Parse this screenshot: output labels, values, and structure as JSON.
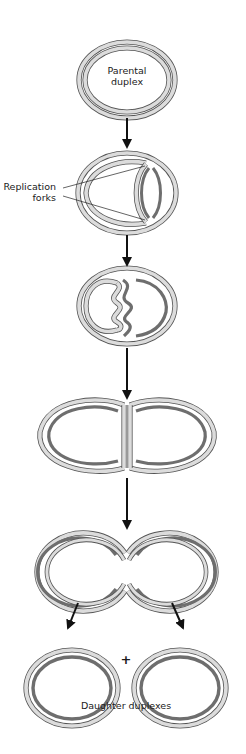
{
  "colors": {
    "outline": "#555555",
    "old_strand_fill": "#d9d9d9",
    "new_strand": "#6e6e6e",
    "arrow": "#111111",
    "text": "#1a1a1a",
    "background": "#ffffff"
  },
  "labels": {
    "parental": [
      "Parental",
      "duplex"
    ],
    "forks": [
      "Replication",
      "forks"
    ],
    "plus": "+",
    "daughters": "Daughter duplexes"
  },
  "stages": [
    {
      "id": "parental-duplex",
      "cx": 127,
      "cy": 80,
      "rx": 48,
      "ry": 38
    },
    {
      "id": "replication-forks",
      "cx": 127,
      "cy": 193,
      "rx": 49,
      "ry": 40
    },
    {
      "id": "supercoiled-intermediate",
      "cx": 127,
      "cy": 306,
      "rx": 48,
      "ry": 38
    },
    {
      "id": "catenated-pair",
      "cy": 437,
      "left_cx": 83,
      "right_cx": 169,
      "rx": 45,
      "ry": 37
    },
    {
      "id": "separating-pair",
      "cy": 572,
      "left_cx": 77,
      "right_cx": 176,
      "rx": 47,
      "ry": 39
    },
    {
      "id": "daughter-duplexes",
      "cy": 688,
      "left_cx": 72,
      "right_cx": 180,
      "rx": 46,
      "ry": 38
    }
  ],
  "arrows": [
    {
      "x1": 127,
      "y1": 118,
      "x2": 127,
      "y2": 147
    },
    {
      "x1": 127,
      "y1": 235,
      "x2": 127,
      "y2": 265
    },
    {
      "x1": 127,
      "y1": 348,
      "x2": 127,
      "y2": 398
    },
    {
      "x1": 127,
      "y1": 478,
      "x2": 127,
      "y2": 528
    },
    {
      "x1": 78,
      "y1": 603,
      "x2": 68,
      "y2": 628
    },
    {
      "x1": 172,
      "y1": 603,
      "x2": 183,
      "y2": 628
    }
  ]
}
